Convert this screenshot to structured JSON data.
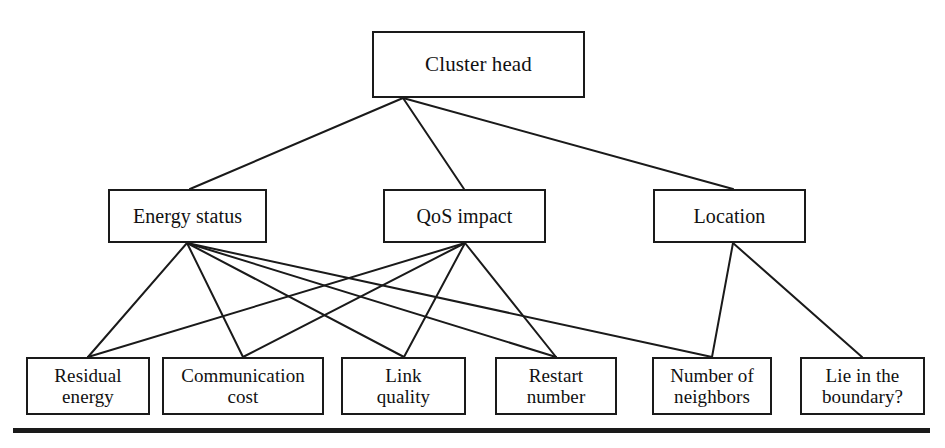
{
  "diagram": {
    "type": "hierarchy-tree",
    "line_color": "#1a1a1a",
    "box_border_color": "#1a1a1a",
    "background_color": "#ffffff",
    "levels": [
      {
        "name": "goal",
        "nodes": [
          {
            "id": "cluster-head",
            "label": "Cluster head",
            "x": 372,
            "y": 31,
            "w": 213,
            "h": 67
          }
        ]
      },
      {
        "name": "criteria",
        "nodes": [
          {
            "id": "energy-status",
            "label": "Energy status",
            "x": 108,
            "y": 189,
            "w": 159,
            "h": 54
          },
          {
            "id": "qos-impact",
            "label": "QoS impact",
            "x": 383,
            "y": 189,
            "w": 163,
            "h": 54
          },
          {
            "id": "location",
            "label": "Location",
            "x": 653,
            "y": 189,
            "w": 153,
            "h": 54
          }
        ]
      },
      {
        "name": "sub-criteria",
        "nodes": [
          {
            "id": "residual-energy",
            "label": "Residual\nenergy",
            "x": 26,
            "y": 357,
            "w": 124,
            "h": 58
          },
          {
            "id": "communication-cost",
            "label": "Communication\ncost",
            "x": 162,
            "y": 357,
            "w": 162,
            "h": 58
          },
          {
            "id": "link-quality",
            "label": "Link\nquality",
            "x": 341,
            "y": 357,
            "w": 125,
            "h": 58
          },
          {
            "id": "restart-number",
            "label": "Restart\nnumber",
            "x": 495,
            "y": 357,
            "w": 122,
            "h": 58
          },
          {
            "id": "number-of-neighbors",
            "label": "Number of\nneighbors",
            "x": 652,
            "y": 357,
            "w": 120,
            "h": 58
          },
          {
            "id": "lie-in-the-boundary",
            "label": "Lie in the\nboundary?",
            "x": 800,
            "y": 357,
            "w": 125,
            "h": 58
          }
        ]
      }
    ],
    "edges": [
      {
        "from": "cluster-head",
        "to": "energy-status",
        "x1": 403,
        "y1": 98,
        "x2": 190,
        "y2": 189
      },
      {
        "from": "cluster-head",
        "to": "qos-impact",
        "x1": 403,
        "y1": 98,
        "x2": 464,
        "y2": 189
      },
      {
        "from": "cluster-head",
        "to": "location",
        "x1": 403,
        "y1": 98,
        "x2": 733,
        "y2": 189
      },
      {
        "from": "energy-status",
        "to": "residual-energy",
        "x1": 187,
        "y1": 243,
        "x2": 88,
        "y2": 357
      },
      {
        "from": "energy-status",
        "to": "communication-cost",
        "x1": 187,
        "y1": 243,
        "x2": 243,
        "y2": 357
      },
      {
        "from": "energy-status",
        "to": "link-quality",
        "x1": 187,
        "y1": 243,
        "x2": 404,
        "y2": 357
      },
      {
        "from": "energy-status",
        "to": "restart-number",
        "x1": 187,
        "y1": 243,
        "x2": 556,
        "y2": 357
      },
      {
        "from": "energy-status",
        "to": "number-of-neighbors",
        "x1": 187,
        "y1": 243,
        "x2": 712,
        "y2": 357
      },
      {
        "from": "qos-impact",
        "to": "residual-energy",
        "x1": 465,
        "y1": 243,
        "x2": 88,
        "y2": 357
      },
      {
        "from": "qos-impact",
        "to": "communication-cost",
        "x1": 465,
        "y1": 243,
        "x2": 243,
        "y2": 357
      },
      {
        "from": "qos-impact",
        "to": "link-quality",
        "x1": 465,
        "y1": 243,
        "x2": 404,
        "y2": 357
      },
      {
        "from": "qos-impact",
        "to": "restart-number",
        "x1": 465,
        "y1": 243,
        "x2": 556,
        "y2": 357
      },
      {
        "from": "location",
        "to": "number-of-neighbors",
        "x1": 733,
        "y1": 243,
        "x2": 712,
        "y2": 357
      },
      {
        "from": "location",
        "to": "lie-in-the-boundary",
        "x1": 733,
        "y1": 243,
        "x2": 862,
        "y2": 357
      }
    ],
    "bottom_rule": {
      "x": 13,
      "y": 428,
      "w": 917,
      "h": 5
    }
  }
}
